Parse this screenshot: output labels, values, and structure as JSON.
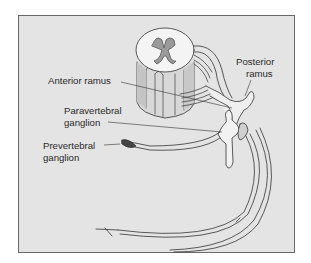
{
  "figure": {
    "background": "#e4e4e4",
    "border_color": "#6a6a6a",
    "labels": {
      "anterior_ramus": "Anterior ramus",
      "posterior_ramus_line1": "Posterior",
      "posterior_ramus_line2": "ramus",
      "paravertebral_line1": "Paravertebral",
      "paravertebral_line2": "ganglion",
      "prevertebral_line1": "Prevertebral",
      "prevertebral_line2": "ganglion"
    }
  }
}
